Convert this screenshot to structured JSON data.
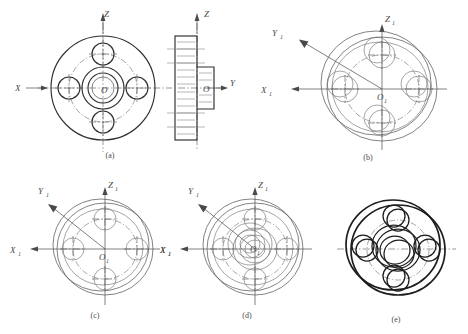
{
  "figure": {
    "background": "#ffffff",
    "ink": "#2e2e2e",
    "thin_ink": "#6a6a6a"
  },
  "panels": [
    {
      "id": "a",
      "caption": "(a)",
      "caption_x": 110,
      "caption_y": 158,
      "description": "Orthographic views: front view with bolt circle and section side view",
      "axes": [
        {
          "name": "X",
          "label": "X",
          "subscript": "",
          "x": 15,
          "y": 91,
          "kind": "axis-label-x"
        },
        {
          "name": "Z",
          "label": "Z",
          "subscript": "",
          "x": 104,
          "y": 17,
          "kind": "axis-label-z"
        },
        {
          "name": "Y",
          "label": "Y",
          "subscript": "",
          "x": 230,
          "y": 86,
          "kind": "axis-label-y"
        },
        {
          "name": "O",
          "label": "O",
          "subscript": "",
          "x": 101,
          "y": 93,
          "kind": "origin-label"
        },
        {
          "name": "O-side",
          "label": "O",
          "subscript": "",
          "x": 206,
          "y": 90,
          "kind": "origin-label"
        },
        {
          "name": "Z-side",
          "label": "Z",
          "subscript": "",
          "x": 206,
          "y": 17,
          "kind": "axis-label-z"
        }
      ]
    },
    {
      "id": "b",
      "caption": "(b)",
      "caption_x": 368,
      "caption_y": 160,
      "description": "Stage 1 — outline ellipses of the two cylindrical discs laid out on the axonometric axes",
      "axes": [
        {
          "name": "X1",
          "label": "X",
          "subscript": "1",
          "x": 261,
          "y": 93,
          "kind": "axis-label-x"
        },
        {
          "name": "Y1",
          "label": "Y",
          "subscript": "1",
          "x": 272,
          "y": 36,
          "kind": "axis-label-y"
        },
        {
          "name": "Z1",
          "label": "Z",
          "subscript": "1",
          "x": 385,
          "y": 22,
          "kind": "axis-label-z"
        },
        {
          "name": "O1",
          "label": "O",
          "subscript": "1",
          "x": 382,
          "y": 100,
          "kind": "origin-label"
        }
      ]
    },
    {
      "id": "c",
      "caption": "(c)",
      "caption_x": 95,
      "caption_y": 318,
      "description": "Stage 2 — bolt-hole circle and four bolt holes drawn on the flange face",
      "axes": [
        {
          "name": "X1",
          "label": "X",
          "subscript": "1",
          "x": 22,
          "y": 250,
          "kind": "axis-label-x"
        },
        {
          "name": "X1-right",
          "label": "X",
          "subscript": "1",
          "x": 165,
          "y": 250,
          "kind": "axis-label-x"
        },
        {
          "name": "Y1",
          "label": "Y",
          "subscript": "1",
          "x": 38,
          "y": 194,
          "kind": "axis-label-y"
        },
        {
          "name": "Z1",
          "label": "Z",
          "subscript": "1",
          "x": 110,
          "y": 185,
          "kind": "axis-label-z"
        },
        {
          "name": "O1",
          "label": "O",
          "subscript": "1",
          "x": 105,
          "y": 258,
          "kind": "origin-label"
        }
      ]
    },
    {
      "id": "d",
      "caption": "(d)",
      "caption_x": 247,
      "caption_y": 318,
      "description": "Stage 3 — central boss and bore ellipses added",
      "axes": [
        {
          "name": "X1",
          "label": "X",
          "subscript": "1",
          "x": 170,
          "y": 250,
          "kind": "axis-label-x"
        },
        {
          "name": "Y1",
          "label": "Y",
          "subscript": "1",
          "x": 190,
          "y": 194,
          "kind": "axis-label-y"
        },
        {
          "name": "Z1",
          "label": "Z",
          "subscript": "1",
          "x": 262,
          "y": 185,
          "kind": "axis-label-z"
        },
        {
          "name": "O1",
          "label": "O",
          "subscript": "1",
          "x": 255,
          "y": 252,
          "kind": "origin-label"
        }
      ]
    },
    {
      "id": "e",
      "caption": "(e)",
      "caption_x": 396,
      "caption_y": 322,
      "description": "Stage 4 — construction lines removed, outlines darkened to finished pictorial view",
      "axes": []
    }
  ]
}
